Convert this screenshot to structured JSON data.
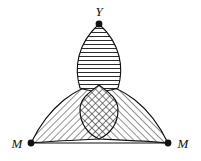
{
  "figure": {
    "name": "three-petal-overlap-diagram",
    "background_color": "#ffffff",
    "stroke_color": "#111111",
    "hatch_color": "#333333",
    "width": 201,
    "height": 161
  },
  "labels": {
    "apex": "Y",
    "left": "M",
    "right": "M"
  },
  "vertices": [
    {
      "name": "apex-vertex",
      "label": "Y",
      "x": 99,
      "y": 24,
      "label_x": 99,
      "label_y": 16
    },
    {
      "name": "left-vertex",
      "label": "M",
      "x": 31,
      "y": 143,
      "label_x": 17,
      "label_y": 148
    },
    {
      "name": "right-vertex",
      "label": "M",
      "x": 168,
      "y": 143,
      "label_x": 183,
      "label_y": 148
    }
  ],
  "petals": [
    {
      "name": "top-petal",
      "from": "apex-vertex",
      "to": "center",
      "hatch": "horizontal",
      "hatch_angle_deg": 0,
      "path": "M 99 24 C 121 44 124 68 118 88 C 108 92 90 92 80 88 C 74 68 77 44 99 24 Z"
    },
    {
      "name": "left-petal",
      "from": "left-vertex",
      "to": "center",
      "hatch": "diagonal-up",
      "hatch_angle_deg": 45,
      "path": "M 31 143 C 50 104 78 86 99 85 C 106 97 107 120 99 139 C 78 140 52 141 31 143 Z"
    },
    {
      "name": "right-petal",
      "from": "right-vertex",
      "to": "center",
      "hatch": "diagonal-down",
      "hatch_angle_deg": -45,
      "path": "M 168 143 C 149 104 121 86 99 85 C 92 97 92 120 99 139 C 121 140 147 141 168 143 Z"
    }
  ],
  "intersection": {
    "name": "triple-overlap-region",
    "hatch": "cross-hatch",
    "path": "M 99 85 C 108 92 118 98 118 110 C 118 124 110 134 99 139 C 88 134 80 124 80 110 C 80 98 90 92 99 85 Z"
  },
  "baseline": {
    "name": "baseline-segment",
    "x1": 31,
    "y1": 143,
    "x2": 168,
    "y2": 143
  }
}
